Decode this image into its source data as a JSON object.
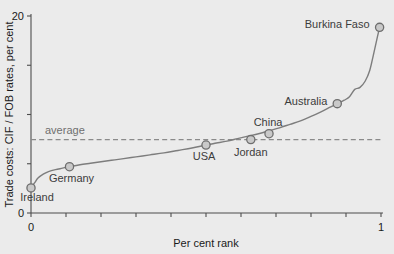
{
  "chart_data": {
    "type": "line",
    "title": "",
    "xlabel": "Per cent rank",
    "ylabel": "Trade costs: CIF / FOB rates, per cent",
    "xlim": [
      0,
      1
    ],
    "ylim": [
      0,
      20
    ],
    "grid": false,
    "legend": null,
    "x_ticklabels": [
      "0",
      "1"
    ],
    "x_ticklabel_values": [
      0,
      1
    ],
    "x_minor_ticks": [
      0.1,
      0.2,
      0.3,
      0.4,
      0.5,
      0.6,
      0.7,
      0.8,
      0.9
    ],
    "y_ticklabels": [
      "0",
      "20"
    ],
    "y_ticklabel_values": [
      0,
      20
    ],
    "y_minor_ticks": [
      5,
      10,
      15
    ],
    "series": [
      {
        "name": "Trade costs by percentile rank",
        "x": [
          0.0,
          0.01,
          0.02,
          0.035,
          0.05,
          0.07,
          0.09,
          0.11,
          0.14,
          0.17,
          0.2,
          0.23,
          0.26,
          0.3,
          0.34,
          0.38,
          0.42,
          0.46,
          0.5,
          0.53,
          0.56,
          0.59,
          0.62,
          0.65,
          0.68,
          0.71,
          0.74,
          0.77,
          0.8,
          0.83,
          0.855,
          0.875,
          0.895,
          0.91,
          0.925,
          0.94,
          0.955,
          0.968,
          0.978,
          0.988,
          0.996
        ],
        "y": [
          2.55,
          3.05,
          3.55,
          3.95,
          4.2,
          4.4,
          4.55,
          4.7,
          4.9,
          5.05,
          5.2,
          5.35,
          5.5,
          5.7,
          5.9,
          6.1,
          6.35,
          6.6,
          6.9,
          7.1,
          7.3,
          7.55,
          7.8,
          8.05,
          8.35,
          8.65,
          9.0,
          9.35,
          9.8,
          10.3,
          10.75,
          11.1,
          11.45,
          11.8,
          12.55,
          12.75,
          13.4,
          14.5,
          16.0,
          17.6,
          18.85
        ]
      }
    ],
    "average_line": {
      "label": "average",
      "value": 7.45,
      "style": "dashed"
    },
    "annotated_points": [
      {
        "label": "Ireland",
        "x": 0.0,
        "y": 2.55,
        "label_dx": 6,
        "label_dy": 13
      },
      {
        "label": "Germany",
        "x": 0.11,
        "y": 4.7,
        "label_dx": 2,
        "label_dy": 15
      },
      {
        "label": "USA",
        "x": 0.5,
        "y": 6.9,
        "label_dx": -2,
        "label_dy": 15
      },
      {
        "label": "Jordan",
        "x": 0.628,
        "y": 7.45,
        "label_dx": 0,
        "label_dy": 16
      },
      {
        "label": "China",
        "x": 0.68,
        "y": 8.05,
        "label_dx": -1,
        "label_dy": -8
      },
      {
        "label": "Australia",
        "x": 0.875,
        "y": 11.1,
        "label_dx": -10,
        "label_dy": 1,
        "anchor": "end"
      },
      {
        "label": "Burkina Faso",
        "x": 0.996,
        "y": 18.85,
        "label_dx": -10,
        "label_dy": 1,
        "anchor": "end"
      }
    ]
  },
  "colors": {
    "background": "#ebebeb",
    "curve": "#7d7d7d",
    "marker_fill": "#c9c9c9",
    "marker_stroke": "#6e6e6e",
    "average_line": "#8a8a8a",
    "average_label": "#6f6f6f",
    "axis": "#4d4d4d",
    "text": "#1a1a1a"
  }
}
